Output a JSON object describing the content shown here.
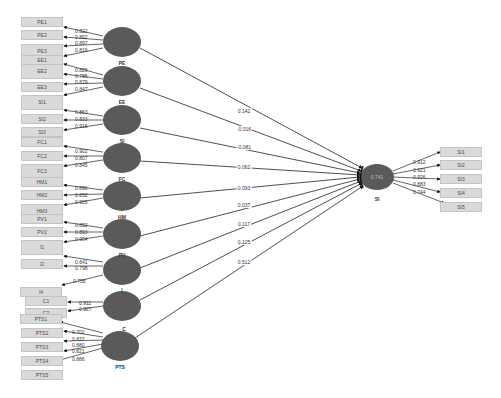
{
  "diagram": {
    "type": "PLS-SEM path model",
    "endogenous": {
      "id": "SI",
      "label": "SI",
      "r2": "0.741"
    },
    "constructs": [
      {
        "id": "PE",
        "label": "PE",
        "path": "0.142"
      },
      {
        "id": "EE",
        "label": "EE",
        "path": "-0.016"
      },
      {
        "id": "SI_exo",
        "label": "SI",
        "path": "-0.081"
      },
      {
        "id": "FC",
        "label": "FC",
        "path": "0.062"
      },
      {
        "id": "HM",
        "label": "HM",
        "path": "0.093"
      },
      {
        "id": "PV",
        "label": "PV",
        "path": "0.037"
      },
      {
        "id": "I",
        "label": "I",
        "path": "0.117"
      },
      {
        "id": "C",
        "label": "C",
        "path": "0.125"
      },
      {
        "id": "PTS",
        "label": "PTS",
        "path": "0.512"
      }
    ],
    "left_indicators": [
      {
        "label": "PE1",
        "loading": "0.822"
      },
      {
        "label": "PE2",
        "loading": "0.892"
      },
      {
        "label": "PE3",
        "loading": "0.897"
      },
      {
        "label": "EE1",
        "loading": "0.816"
      },
      {
        "label": "EE2",
        "loading": "0.829"
      },
      {
        "label": "EE3",
        "loading": "0.785"
      },
      {
        "label": "SI1",
        "loading": "0.879"
      },
      {
        "label": "SI2",
        "loading": "0.847"
      },
      {
        "label": "SI3",
        "loading": "0.863"
      },
      {
        "label": "FC1",
        "loading": "0.833"
      },
      {
        "label": "FC2",
        "loading": "0.916"
      },
      {
        "label": "FC3",
        "loading": "0.902"
      },
      {
        "label": "HM1",
        "loading": "0.807"
      },
      {
        "label": "HM2",
        "loading": "0.845"
      },
      {
        "label": "HM3",
        "loading": "0.890"
      },
      {
        "label": "PV1",
        "loading": "0.852"
      },
      {
        "label": "PV2",
        "loading": "0.905"
      },
      {
        "label": "I1",
        "loading": "0.852"
      },
      {
        "label": "I2",
        "loading": "0.893"
      },
      {
        "label": "I4",
        "loading": "0.904"
      },
      {
        "label": "C1",
        "loading": "0.641"
      },
      {
        "label": "C2",
        "loading": "0.798"
      },
      {
        "label": "PTS1",
        "loading": "0.758"
      },
      {
        "label": "PTS2",
        "loading": "0.911"
      },
      {
        "label": "PTS3",
        "loading": "0.927"
      },
      {
        "label": "PTS4",
        "loading": "0.702"
      },
      {
        "label": "PTS5",
        "loading": "0.837"
      }
    ],
    "pts_extra_loadings": [
      "0.880",
      "0.821",
      "0.886"
    ],
    "right_indicators": [
      {
        "label": "SI1",
        "loading": "0.912"
      },
      {
        "label": "SI2",
        "loading": "0.921"
      },
      {
        "label": "SI3",
        "loading": "0.926"
      },
      {
        "label": "SI4",
        "loading": "0.883"
      },
      {
        "label": "SI5",
        "loading": "0.744"
      }
    ],
    "colors": {
      "construct_fill": "#555555",
      "indicator_fill": "#dadada",
      "line": "#222222"
    }
  }
}
